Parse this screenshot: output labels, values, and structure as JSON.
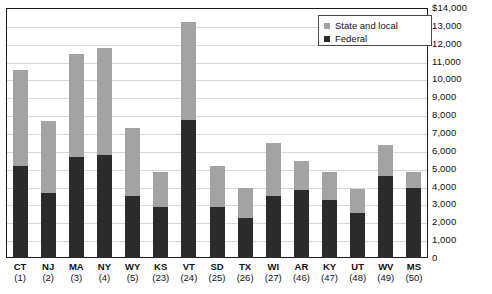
{
  "chart_data": {
    "type": "bar",
    "stacked": true,
    "title": "",
    "xlabel": "",
    "ylabel": "",
    "ylim": [
      0,
      14000
    ],
    "grid": true,
    "legend_position": "top-right",
    "categories": [
      "CT",
      "NJ",
      "MA",
      "NY",
      "WY",
      "KS",
      "VT",
      "SD",
      "TX",
      "WI",
      "AR",
      "KY",
      "UT",
      "WV",
      "MS"
    ],
    "category_ranks": [
      "(1)",
      "(2)",
      "(3)",
      "(4)",
      "(5)",
      "(23)",
      "(24)",
      "(25)",
      "(26)",
      "(27)",
      "(46)",
      "(47)",
      "(48)",
      "(49)",
      "(50)"
    ],
    "series": [
      {
        "name": "Federal",
        "color": "#2b2b2b",
        "values": [
          5150,
          3640,
          5650,
          5770,
          3470,
          2860,
          7730,
          2860,
          2240,
          3470,
          3810,
          3250,
          2520,
          4590,
          3920
        ]
      },
      {
        "name": "State and local",
        "color": "#a3a3a3",
        "values": [
          5380,
          4030,
          5770,
          5980,
          3810,
          1960,
          5470,
          2290,
          1680,
          2970,
          1620,
          1570,
          1340,
          1740,
          900
        ]
      }
    ],
    "totals": [
      10530,
      7670,
      11420,
      11750,
      7280,
      4820,
      13200,
      5150,
      3920,
      6440,
      5430,
      4820,
      3860,
      6330,
      4820
    ],
    "y_ticks": [
      {
        "value": 14000,
        "label": "$14,000"
      },
      {
        "value": 13000,
        "label": "13,000"
      },
      {
        "value": 12000,
        "label": "12,000"
      },
      {
        "value": 11000,
        "label": "11,000"
      },
      {
        "value": 10000,
        "label": "10,000"
      },
      {
        "value": 9000,
        "label": "9,000"
      },
      {
        "value": 8000,
        "label": "8,000"
      },
      {
        "value": 7000,
        "label": "7,000"
      },
      {
        "value": 6000,
        "label": "6,000"
      },
      {
        "value": 5000,
        "label": "5,000"
      },
      {
        "value": 4000,
        "label": "4,000"
      },
      {
        "value": 3000,
        "label": "3,000"
      },
      {
        "value": 2000,
        "label": "2,000"
      },
      {
        "value": 1000,
        "label": "1,000"
      },
      {
        "value": 0,
        "label": "0"
      }
    ]
  },
  "legend": {
    "items": [
      {
        "label": "State and local",
        "color": "#a3a3a3"
      },
      {
        "label": "Federal",
        "color": "#2b2b2b"
      }
    ]
  },
  "title_sliver": ""
}
